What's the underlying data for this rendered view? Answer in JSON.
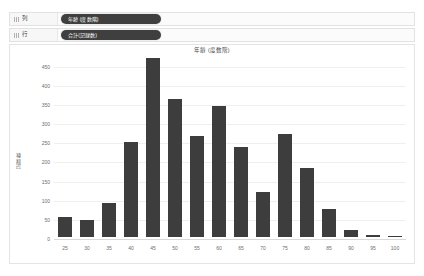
{
  "shelves": [
    {
      "label": "列",
      "icon": "grid-icon",
      "pill": "年齢 (度数階)"
    },
    {
      "label": "行",
      "icon": "grid-icon",
      "pill": "合計(記録数)"
    }
  ],
  "chart_data": {
    "type": "bar",
    "title": "年齢 (度数階)",
    "xlabel": "",
    "ylabel": "記録数",
    "categories": [
      "25",
      "30",
      "35",
      "40",
      "45",
      "50",
      "55",
      "60",
      "65",
      "70",
      "75",
      "80",
      "85",
      "90",
      "95",
      "100"
    ],
    "values": [
      52,
      45,
      90,
      248,
      468,
      360,
      265,
      342,
      235,
      118,
      270,
      180,
      72,
      18,
      4,
      3
    ],
    "ylim": [
      0,
      470
    ],
    "yticks": [
      0,
      50,
      100,
      150,
      200,
      250,
      300,
      350,
      400,
      450
    ],
    "grid": true,
    "legend": "none",
    "bar_color": "#3d3d3d"
  },
  "colors": {
    "pill_background": "#3f3f3f",
    "pill_text": "#ffffff",
    "bar": "#3d3d3d",
    "panel_border": "#e4e4e4",
    "gridline": "#efefef"
  }
}
